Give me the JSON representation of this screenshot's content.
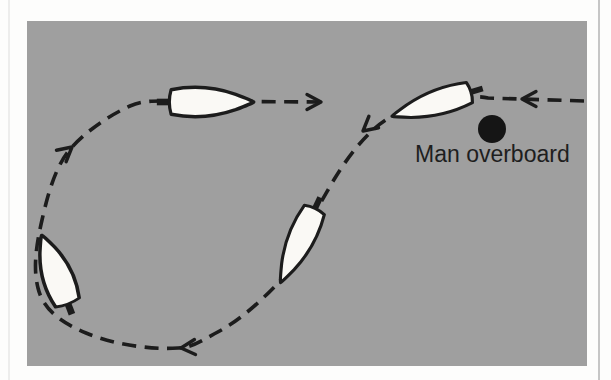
{
  "figure": {
    "title_label": "Man overboard",
    "panel": {
      "x": 27,
      "y": 21,
      "width": 560,
      "height": 345,
      "background": "#9f9f9f"
    },
    "colors": {
      "ink": "#1c1c1c",
      "boat_fill": "#faf9f5",
      "label_text": "#1e1e1e",
      "page_background": "#fdfdfc"
    },
    "route": {
      "path": "M 584 101 L 488 98 C 469 93 432 104 395 115 C 374 124 352 150 335 178 C 322 199 296 248 281 280 C 262 300 240 321 214 334 C 200 342 190 348 178 348 C 150 350 112 344 86 333 C 60 322 43 309 38 288 C 33 268 36 246 42 220 C 47 198 55 165 72 147 C 86 132 106 117 130 106 C 142 101 152 101 162 101 L 320 102",
      "dash_pattern": "14 8.5",
      "stroke_width": 3.6
    },
    "arrows": [
      {
        "name": "arrow-approach-left",
        "x": 522,
        "y": 99,
        "angle": 180
      },
      {
        "name": "arrow-turn-downleft",
        "x": 363,
        "y": 131,
        "angle": 140
      },
      {
        "name": "arrow-bottom-left",
        "x": 181,
        "y": 348,
        "angle": 176
      },
      {
        "name": "arrow-rise-upright",
        "x": 72,
        "y": 147,
        "angle": -40
      },
      {
        "name": "arrow-return-right",
        "x": 321,
        "y": 102,
        "angle": 0
      }
    ],
    "boats": [
      {
        "name": "boat-top-left-heading-right",
        "x": 211,
        "y": 102,
        "angle": 0,
        "sx": 0.95,
        "sy": 1.02
      },
      {
        "name": "boat-top-right-heading-left",
        "x": 432,
        "y": 104,
        "angle": 163,
        "sx": 0.93,
        "sy": 0.88
      },
      {
        "name": "boat-middle-heading-downleft",
        "x": 298,
        "y": 245,
        "angle": 115,
        "sx": 0.92,
        "sy": 0.92
      },
      {
        "name": "boat-bottom-left-heading-up",
        "x": 55,
        "y": 270,
        "angle": -111,
        "sx": 0.83,
        "sy": 1.05
      }
    ],
    "mob_marker": {
      "cx": 492,
      "cy": 129,
      "r": 14,
      "color": "#151515"
    },
    "label_layout": {
      "x": 415,
      "y": 162,
      "font_size": 23
    }
  }
}
